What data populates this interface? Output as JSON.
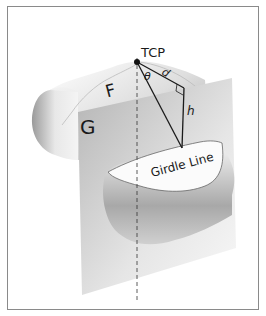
{
  "diagram": {
    "labels": {
      "tcp": "TCP",
      "plane_f": "F",
      "plane_g": "G",
      "angle": "θ",
      "distance": "d",
      "height": "h",
      "girdle": "Girdle Line"
    },
    "colors": {
      "frame": "#8a8a8a",
      "line": "#1a1a1a",
      "plane_g": "#c8c8c8",
      "tooth_shade": "#a0a0a0"
    }
  }
}
